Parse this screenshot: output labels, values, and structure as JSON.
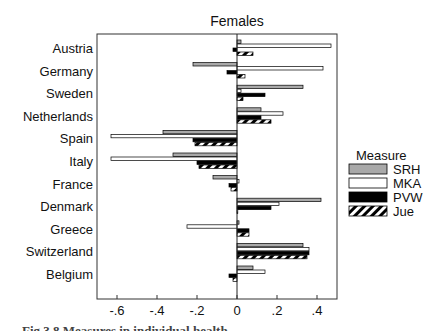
{
  "chart_data": {
    "type": "bar",
    "orientation": "horizontal",
    "title": "Females",
    "xlabel": "",
    "ylabel": "",
    "xlim": [
      -0.7,
      0.5
    ],
    "xticks": [
      -0.6,
      -0.4,
      -0.2,
      0,
      0.2,
      0.4
    ],
    "xtick_labels": [
      "-.6",
      "-.4",
      "-.2",
      "0",
      ".2",
      ".4"
    ],
    "grid": false,
    "legend_title": "Measure",
    "legend_position": "right",
    "categories": [
      "Austria",
      "Germany",
      "Sweden",
      "Netherlands",
      "Spain",
      "Italy",
      "France",
      "Denmark",
      "Greece",
      "Switzerland",
      "Belgium"
    ],
    "series": [
      {
        "name": "SRH",
        "fill": "#a9a9a9",
        "pattern": "solid",
        "values": [
          0.02,
          -0.22,
          0.33,
          0.12,
          -0.37,
          -0.32,
          -0.12,
          0.42,
          0.01,
          0.33,
          0.08
        ]
      },
      {
        "name": "MKA",
        "fill": "#ffffff",
        "pattern": "solid",
        "values": [
          0.47,
          0.43,
          0.02,
          0.23,
          -0.63,
          -0.63,
          0.01,
          0.21,
          -0.25,
          0.36,
          0.14
        ]
      },
      {
        "name": "PVW",
        "fill": "#000000",
        "pattern": "solid",
        "values": [
          -0.02,
          -0.05,
          0.14,
          0.12,
          -0.22,
          -0.2,
          -0.04,
          0.17,
          0.06,
          0.36,
          -0.04
        ]
      },
      {
        "name": "Jue",
        "fill": "#ffffff",
        "pattern": "hatched",
        "values": [
          0.08,
          0.04,
          0.03,
          0.17,
          -0.21,
          -0.19,
          -0.03,
          0.0,
          0.06,
          0.35,
          -0.02
        ]
      }
    ]
  },
  "caption": "Fig 3.8   Measures in individual health ..."
}
